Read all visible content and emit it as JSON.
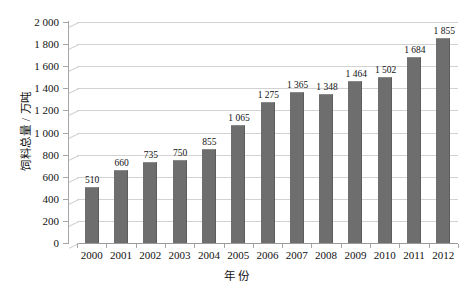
{
  "chart_data": {
    "type": "bar",
    "title": "",
    "xlabel": "年份",
    "ylabel": "饲料总量 / 万吨",
    "categories": [
      "2000",
      "2001",
      "2002",
      "2003",
      "2004",
      "2005",
      "2006",
      "2007",
      "2008",
      "2009",
      "2010",
      "2011",
      "2012"
    ],
    "values": [
      510,
      660,
      735,
      750,
      855,
      1065,
      1275,
      1365,
      1348,
      1464,
      1502,
      1684,
      1855
    ],
    "value_labels": [
      "510",
      "660",
      "735",
      "750",
      "855",
      "1 065",
      "1 275",
      "1 365",
      "1 348",
      "1 464",
      "1 502",
      "1 684",
      "1 855"
    ],
    "ylim": [
      0,
      2000
    ],
    "ytick_step": 200,
    "ytick_labels": [
      "0",
      "200",
      "400",
      "600",
      "800",
      "1 000",
      "1 200",
      "1 400",
      "1 600",
      "1 800",
      "2 000"
    ],
    "ytick_values": [
      0,
      200,
      400,
      600,
      800,
      1000,
      1200,
      1400,
      1600,
      1800,
      2000
    ],
    "grid": true,
    "legend": "none",
    "series": [
      {
        "name": "饲料总量",
        "values": [
          510,
          660,
          735,
          750,
          855,
          1065,
          1275,
          1365,
          1348,
          1464,
          1502,
          1684,
          1855
        ]
      }
    ],
    "colors": {
      "bar": "#6e6e6e",
      "gridline": "#d2d2d2",
      "axis": "#a6a6a6",
      "text": "#111111",
      "background": "#ffffff"
    }
  }
}
